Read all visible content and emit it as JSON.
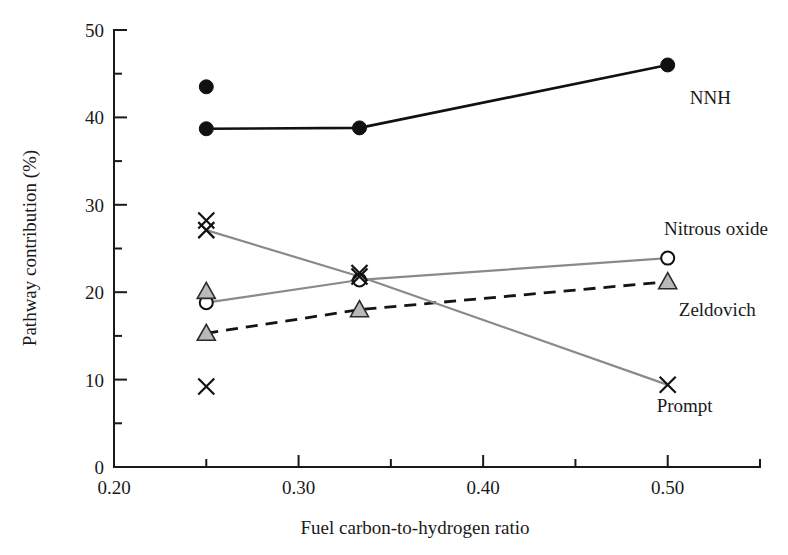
{
  "chart_data": {
    "type": "line",
    "title": "",
    "xlabel": "Fuel carbon-to-hydrogen ratio",
    "ylabel": "Pathway contribution (%)",
    "xlim": [
      0.2,
      0.55
    ],
    "ylim": [
      0,
      50
    ],
    "grid": false,
    "legend_position": "inline-right-of-series",
    "x_ticks_major": [
      "0.20",
      "0.30",
      "0.40",
      "0.50"
    ],
    "x_ticks_major_values": [
      0.2,
      0.3,
      0.4,
      0.5
    ],
    "x_ticks_minor_values": [
      0.25,
      0.35,
      0.45,
      0.55
    ],
    "y_ticks_major": [
      "0",
      "10",
      "20",
      "30",
      "40",
      "50"
    ],
    "y_ticks_major_values": [
      0,
      10,
      20,
      30,
      40,
      50
    ],
    "y_ticks_minor_values": [
      5,
      15,
      25,
      35,
      45
    ],
    "x": [
      0.25,
      0.333,
      0.5
    ],
    "series": [
      {
        "name": "NNH",
        "label": "NNH",
        "marker": "filled-circle",
        "line": "solid",
        "color": "#111111",
        "values": [
          38.7,
          38.8,
          46.0
        ],
        "label_x": 0.512,
        "label_y": 41.5
      },
      {
        "name": "Nitrous oxide",
        "label": "Nitrous oxide",
        "marker": "open-circle",
        "line": "solid",
        "color": "#8a8a8a",
        "values": [
          18.8,
          21.4,
          23.9
        ],
        "label_x": 0.498,
        "label_y": 26.5
      },
      {
        "name": "Zeldovich",
        "label": "Zeldovich",
        "marker": "triangle",
        "line": "dashed",
        "color": "#141414",
        "values": [
          15.3,
          18.0,
          21.2
        ],
        "label_x": 0.506,
        "label_y": 17.3
      },
      {
        "name": "Prompt",
        "label": "Prompt",
        "marker": "cross",
        "line": "solid",
        "color": "#8a8a8a",
        "values": [
          27.1,
          21.8,
          9.4
        ],
        "label_x": 0.494,
        "label_y": 6.3
      }
    ],
    "extra_points": [
      {
        "name": "nnh-upper-point",
        "marker": "filled-circle",
        "x": 0.25,
        "y": 43.5
      },
      {
        "name": "prompt-upper-point",
        "marker": "cross",
        "x": 0.25,
        "y": 28.2
      },
      {
        "name": "zeldovich-upper-point",
        "marker": "triangle",
        "x": 0.25,
        "y": 20.1
      },
      {
        "name": "prompt-lower-point",
        "marker": "cross",
        "x": 0.25,
        "y": 9.2
      },
      {
        "name": "prompt-mid-point",
        "marker": "cross",
        "x": 0.333,
        "y": 22.2
      }
    ]
  }
}
